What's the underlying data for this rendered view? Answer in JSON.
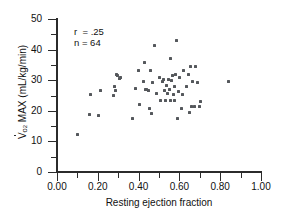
{
  "chart_data": {
    "type": "scatter",
    "title": "",
    "xlabel": "Resting ejection fraction",
    "ylabel_prefix": "V",
    "ylabel_sub": "o2",
    "ylabel_rest": " MAX (mL/kg/min)",
    "ylabel_plain": "Vo2 MAX (mL/kg/min)",
    "xlim": [
      0.0,
      1.0
    ],
    "ylim": [
      0,
      50
    ],
    "xticks": [
      "0.00",
      "0.20",
      "0.40",
      "0.60",
      "0.80",
      "1.00"
    ],
    "xtick_values": [
      0.0,
      0.2,
      0.4,
      0.6,
      0.8,
      1.0
    ],
    "xminor_values": [
      0.1,
      0.3,
      0.5,
      0.7,
      0.9
    ],
    "yticks": [
      "0",
      "10",
      "20",
      "30",
      "40",
      "50"
    ],
    "ytick_values": [
      0,
      10,
      20,
      30,
      40,
      50
    ],
    "yminor_values": [
      5,
      15,
      25,
      35,
      45
    ],
    "grid": false,
    "legend": "none",
    "marker": "square",
    "marker_color": "#55585c",
    "axis_color": "#2b2b2b",
    "annotations": [
      {
        "text": "r  = .25"
      },
      {
        "text": "n = 64"
      }
    ],
    "correlation_r": 0.25,
    "n": 64,
    "points": [
      [
        0.1,
        12.3
      ],
      [
        0.16,
        18.7
      ],
      [
        0.165,
        25.3
      ],
      [
        0.205,
        18.6
      ],
      [
        0.215,
        26.7
      ],
      [
        0.275,
        24.9
      ],
      [
        0.28,
        27.9
      ],
      [
        0.285,
        26.6
      ],
      [
        0.29,
        31.9
      ],
      [
        0.295,
        31.6
      ],
      [
        0.305,
        30.6
      ],
      [
        0.31,
        30.9
      ],
      [
        0.37,
        17.4
      ],
      [
        0.385,
        27.4
      ],
      [
        0.4,
        33.1
      ],
      [
        0.405,
        22.0
      ],
      [
        0.425,
        29.6
      ],
      [
        0.43,
        35.9
      ],
      [
        0.435,
        26.9
      ],
      [
        0.44,
        27.1
      ],
      [
        0.45,
        26.6
      ],
      [
        0.455,
        20.6
      ],
      [
        0.46,
        33.3
      ],
      [
        0.465,
        19.0
      ],
      [
        0.47,
        29.1
      ],
      [
        0.48,
        41.5
      ],
      [
        0.49,
        25.7
      ],
      [
        0.5,
        31.0
      ],
      [
        0.505,
        23.5
      ],
      [
        0.515,
        29.6
      ],
      [
        0.52,
        30.2
      ],
      [
        0.525,
        26.6
      ],
      [
        0.53,
        23.5
      ],
      [
        0.535,
        28.4
      ],
      [
        0.54,
        25.6
      ],
      [
        0.545,
        30.3
      ],
      [
        0.55,
        26.9
      ],
      [
        0.555,
        23.4
      ],
      [
        0.555,
        37.1
      ],
      [
        0.56,
        29.8
      ],
      [
        0.565,
        31.5
      ],
      [
        0.57,
        25.4
      ],
      [
        0.575,
        28.0
      ],
      [
        0.575,
        23.3
      ],
      [
        0.58,
        31.8
      ],
      [
        0.585,
        42.9
      ],
      [
        0.59,
        17.5
      ],
      [
        0.595,
        26.4
      ],
      [
        0.6,
        30.8
      ],
      [
        0.61,
        20.6
      ],
      [
        0.615,
        25.3
      ],
      [
        0.62,
        33.3
      ],
      [
        0.635,
        28.0
      ],
      [
        0.645,
        31.9
      ],
      [
        0.65,
        19.3
      ],
      [
        0.655,
        34.5
      ],
      [
        0.66,
        21.4
      ],
      [
        0.665,
        29.6
      ],
      [
        0.675,
        21.3
      ],
      [
        0.68,
        34.4
      ],
      [
        0.69,
        29.1
      ],
      [
        0.7,
        21.3
      ],
      [
        0.705,
        23.1
      ],
      [
        0.84,
        29.6
      ]
    ]
  }
}
